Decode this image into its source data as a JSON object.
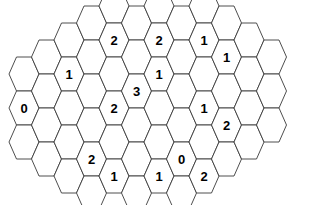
{
  "puzzle": {
    "title": "Hexagonal number grid puzzle",
    "grid_type": "flat-top-hexagon-honeycomb",
    "background_color": "#ffffff",
    "cell_fill_color": "#ffffff",
    "cell_stroke_color": "#3a3a3a",
    "label_color": "#000000",
    "geometry": {
      "hex_width": 30,
      "hex_height": 34,
      "column_step": 22.5,
      "row_step": 34,
      "origin_x": 24,
      "origin_y": 108
    },
    "columns": [
      {
        "index": 0,
        "count": 3,
        "y_offset": -34,
        "labels": [
          null,
          "0",
          null
        ]
      },
      {
        "index": 1,
        "count": 4,
        "y_offset": -51,
        "labels": [
          null,
          null,
          null,
          null
        ]
      },
      {
        "index": 2,
        "count": 5,
        "y_offset": -68,
        "labels": [
          null,
          "1",
          null,
          null,
          null
        ]
      },
      {
        "index": 3,
        "count": 6,
        "y_offset": -85,
        "labels": [
          null,
          null,
          null,
          null,
          "2",
          null
        ]
      },
      {
        "index": 4,
        "count": 6,
        "y_offset": -102,
        "labels": [
          null,
          "2",
          null,
          "2",
          null,
          "1"
        ]
      },
      {
        "index": 5,
        "count": 6,
        "y_offset": -85,
        "labels": [
          null,
          null,
          "3",
          null,
          null,
          null
        ]
      },
      {
        "index": 6,
        "count": 6,
        "y_offset": -102,
        "labels": [
          null,
          "2",
          "1",
          null,
          null,
          "1"
        ]
      },
      {
        "index": 7,
        "count": 6,
        "y_offset": -85,
        "labels": [
          null,
          null,
          null,
          null,
          "0",
          null
        ]
      },
      {
        "index": 8,
        "count": 6,
        "y_offset": -102,
        "labels": [
          null,
          "1",
          null,
          "1",
          null,
          "2"
        ]
      },
      {
        "index": 9,
        "count": 5,
        "y_offset": -85,
        "labels": [
          null,
          "1",
          null,
          "2",
          null
        ]
      },
      {
        "index": 10,
        "count": 4,
        "y_offset": -68,
        "labels": [
          null,
          null,
          null,
          null
        ]
      },
      {
        "index": 11,
        "count": 3,
        "y_offset": -51,
        "labels": [
          null,
          null,
          null
        ]
      }
    ],
    "clue_values": [
      "0",
      "1",
      "1",
      "1",
      "1",
      "1",
      "1",
      "1",
      "1",
      "2",
      "2",
      "2",
      "2",
      "2",
      "2",
      "3"
    ],
    "clue_count": 16,
    "total_cells": 60
  }
}
